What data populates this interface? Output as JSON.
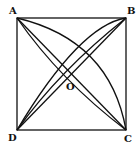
{
  "diagram": {
    "labels": {
      "A": "A",
      "B": "B",
      "C": "C",
      "D": "D",
      "O": "O"
    },
    "shapes": [
      "square ABCD",
      "diagonal AC",
      "diagonal BD",
      "arc A-C",
      "arc A-C (inner)",
      "arc B-D",
      "arc B-D (inner)"
    ],
    "stroke_color": "#111111"
  }
}
